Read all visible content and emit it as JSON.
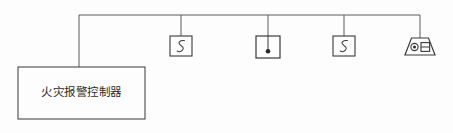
{
  "diagram": {
    "type": "fire-alarm-riser-diagram",
    "colors": {
      "line": "#555555",
      "symbol_stroke": "#3a3a3a",
      "fill": "#2a2a2a",
      "background": "#fdfdfd",
      "text": "#2b2b2b"
    },
    "bus": {
      "name": "signal-bus-line",
      "y": 15,
      "x_start": 79,
      "x_end": 420
    },
    "control_panel": {
      "name": "fire-alarm-control-panel",
      "label": "火灾报警控制器",
      "x": 18,
      "y": 67,
      "width": 127,
      "height": 52,
      "riser_x": 79
    },
    "devices": [
      {
        "name": "smoke-detector-1",
        "symbol": "smoke-detector-s-icon",
        "label": "S",
        "drop_x": 181,
        "box": {
          "x": 170,
          "y": 36,
          "width": 22,
          "height": 20
        }
      },
      {
        "name": "manual-call-point",
        "symbol": "manual-call-point-icon",
        "label": "",
        "drop_x": 268,
        "box": {
          "x": 256,
          "y": 36,
          "width": 24,
          "height": 22
        }
      },
      {
        "name": "smoke-detector-2",
        "symbol": "smoke-detector-s-icon",
        "label": "S",
        "drop_x": 344,
        "box": {
          "x": 333,
          "y": 36,
          "width": 22,
          "height": 20
        }
      },
      {
        "name": "alarm-sounder-strobe",
        "symbol": "alarm-sounder-strobe-icon",
        "label": "",
        "drop_x": 420,
        "box": {
          "x": 405,
          "y": 38,
          "width": 30,
          "height": 17
        }
      }
    ]
  }
}
